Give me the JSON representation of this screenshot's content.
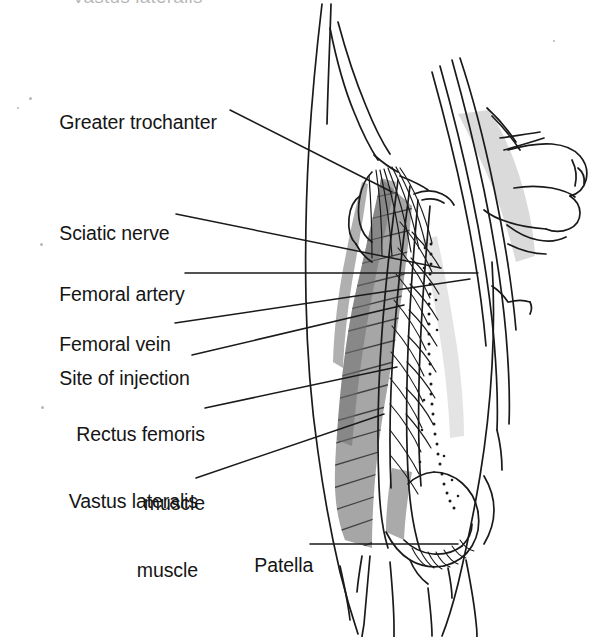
{
  "figure": {
    "title_cropped": "Vastus lateralis",
    "background_color": "#ffffff",
    "line_color": "#1a1a1a",
    "shade_dark": "#8a8a8a",
    "shade_mid": "#a8a8a8",
    "shade_light": "#cfcfcf"
  },
  "labels": [
    {
      "id": "greater-trochanter",
      "line1": "Greater trochanter",
      "line2": "",
      "x": 38,
      "y": 88,
      "leader": {
        "x1": 230,
        "y1": 110,
        "x2": 392,
        "y2": 192
      }
    },
    {
      "id": "sciatic-nerve",
      "line1": "Sciatic nerve",
      "line2": "",
      "x": 38,
      "y": 199,
      "leader": {
        "x1": 176,
        "y1": 214,
        "x2": 441,
        "y2": 268
      }
    },
    {
      "id": "femoral-artery",
      "line1": "Femoral artery",
      "line2": "",
      "x": 38,
      "y": 260,
      "leader": {
        "x1": 185,
        "y1": 273,
        "x2": 478,
        "y2": 273
      }
    },
    {
      "id": "femoral-vein",
      "line1": "Femoral vein",
      "line2": "",
      "x": 38,
      "y": 310,
      "leader": {
        "x1": 175,
        "y1": 323,
        "x2": 470,
        "y2": 279
      }
    },
    {
      "id": "site-of-injection",
      "line1": "Site of injection",
      "line2": "",
      "x": 38,
      "y": 344,
      "leader": {
        "x1": 192,
        "y1": 355,
        "x2": 404,
        "y2": 305
      }
    },
    {
      "id": "rectus-femoris-muscle",
      "line1": "Rectus femoris",
      "line2": "muscle",
      "x": 38,
      "y": 377,
      "leader": {
        "x1": 205,
        "y1": 408,
        "x2": 397,
        "y2": 367
      }
    },
    {
      "id": "vastus-lateralis-muscle",
      "line1": "Vastus lateralis",
      "line2": "muscle",
      "x": 38,
      "y": 444,
      "leader": {
        "x1": 196,
        "y1": 478,
        "x2": 384,
        "y2": 414
      }
    },
    {
      "id": "patella",
      "line1": "Patella",
      "line2": "",
      "x": 233,
      "y": 531,
      "leader": {
        "x1": 310,
        "y1": 544,
        "x2": 458,
        "y2": 544
      }
    }
  ],
  "specks": [
    {
      "x": 29,
      "y": 97,
      "d": 3
    },
    {
      "x": 17,
      "y": 107,
      "d": 2
    },
    {
      "x": 40,
      "y": 243,
      "d": 3
    },
    {
      "x": 41,
      "y": 406,
      "d": 3
    },
    {
      "x": 553,
      "y": 40,
      "d": 2
    }
  ]
}
